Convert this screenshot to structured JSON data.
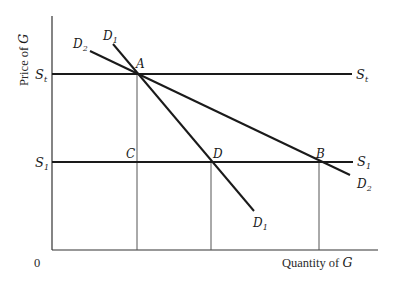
{
  "diagram": {
    "type": "supply-demand",
    "axes": {
      "x_label_prefix": "Quantity of ",
      "x_label_var": "G",
      "y_label_prefix": "Price of ",
      "y_label_var": "G",
      "origin_label": "0"
    },
    "price_levels": {
      "St": {
        "label": "S",
        "sub": "t"
      },
      "S1": {
        "label": "S",
        "sub": "1"
      }
    },
    "demand_curves": {
      "D1": {
        "label": "D",
        "sub": "1"
      },
      "D2": {
        "label": "D",
        "sub": "2"
      }
    },
    "points": {
      "A": "A",
      "B": "B",
      "C": "C",
      "D": "D"
    },
    "colors": {
      "line": "#1a1a1a",
      "guide": "#555555"
    }
  }
}
